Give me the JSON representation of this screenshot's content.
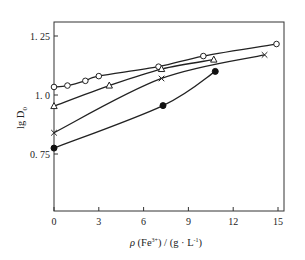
{
  "chart_data": {
    "type": "line",
    "title": "",
    "xlabel": "ρ (Fe³⁺) / (g · L⁻¹)",
    "ylabel": "lg D₀",
    "xlim": [
      0,
      15
    ],
    "ylim": [
      0.5,
      1.3
    ],
    "x_ticks": [
      0,
      3,
      6,
      9,
      12,
      15
    ],
    "x_tick_labels": [
      "0",
      "3",
      "6",
      "9",
      "12",
      "15"
    ],
    "y_ticks": [
      0.75,
      1.0,
      1.25
    ],
    "y_tick_labels": [
      "0. 75",
      "1. 0",
      "1. 25"
    ],
    "grid": false,
    "legend": null,
    "series": [
      {
        "name": "open-circle",
        "marker": "circle-open",
        "x": [
          0,
          0.9,
          2.1,
          3.0,
          7.0,
          10.0,
          14.9
        ],
        "y": [
          1.034,
          1.04,
          1.06,
          1.08,
          1.12,
          1.165,
          1.216
        ]
      },
      {
        "name": "open-triangle",
        "marker": "triangle-open",
        "x": [
          0,
          3.7,
          7.2,
          10.7
        ],
        "y": [
          0.953,
          1.04,
          1.11,
          1.15
        ]
      },
      {
        "name": "cross",
        "marker": "x",
        "x": [
          0,
          7.2,
          14.1
        ],
        "y": [
          0.84,
          1.07,
          1.17
        ]
      },
      {
        "name": "filled-circle",
        "marker": "circle-filled",
        "x": [
          0,
          7.3,
          10.8
        ],
        "y": [
          0.775,
          0.955,
          1.1
        ]
      }
    ]
  },
  "labels": {
    "xlabel_prefix": "ρ",
    "xlabel_main": " (Fe",
    "xlabel_sup": "3+",
    "xlabel_rest": ") / (g · L",
    "xlabel_sup2": "-1",
    "xlabel_end": ")",
    "ylabel_main": "lg D",
    "ylabel_sub": "0"
  }
}
